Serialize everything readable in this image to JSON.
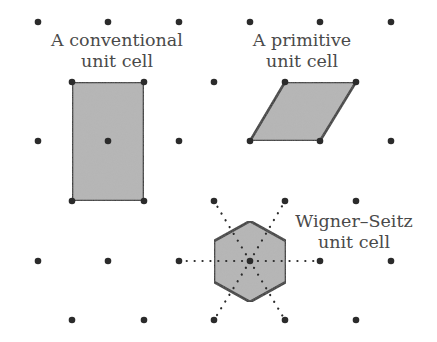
{
  "diagram": {
    "colors": {
      "background": "#ffffff",
      "lattice_point": "#2b2b2b",
      "cell_fill": "#b5b5b5",
      "cell_stroke": "#2b2b2b",
      "label_text": "#4a4a4a"
    },
    "lattice_points": [
      [
        38,
        22
      ],
      [
        108,
        22
      ],
      [
        179,
        22
      ],
      [
        250,
        22
      ],
      [
        320,
        22
      ],
      [
        391,
        22
      ],
      [
        72,
        82
      ],
      [
        144,
        82
      ],
      [
        214,
        82
      ],
      [
        285,
        82
      ],
      [
        356,
        82
      ],
      [
        38,
        141
      ],
      [
        108,
        141
      ],
      [
        179,
        141
      ],
      [
        250,
        141
      ],
      [
        320,
        141
      ],
      [
        391,
        141
      ],
      [
        72,
        201
      ],
      [
        144,
        201
      ],
      [
        214,
        201
      ],
      [
        285,
        201
      ],
      [
        356,
        201
      ],
      [
        38,
        261
      ],
      [
        108,
        261
      ],
      [
        179,
        261
      ],
      [
        250,
        261
      ],
      [
        320,
        261
      ],
      [
        391,
        261
      ],
      [
        72,
        320
      ],
      [
        144,
        320
      ],
      [
        214,
        320
      ],
      [
        285,
        320
      ],
      [
        356,
        320
      ]
    ],
    "cells": {
      "conventional": {
        "label_line1": "A conventional",
        "label_line2": "unit cell",
        "shape": "rectangle",
        "vertices": [
          [
            72,
            82
          ],
          [
            144,
            82
          ],
          [
            144,
            201
          ],
          [
            72,
            201
          ]
        ]
      },
      "primitive": {
        "label_line1": "A primitive",
        "label_line2": "unit cell",
        "shape": "parallelogram",
        "vertices": [
          [
            285,
            82
          ],
          [
            356,
            82
          ],
          [
            320,
            141
          ],
          [
            250,
            141
          ]
        ]
      },
      "wigner_seitz": {
        "label_line1": "Wigner–Seitz",
        "label_line2": "unit cell",
        "shape": "hexagon",
        "center": [
          250,
          261
        ],
        "vertices": [
          [
            250,
            221
          ],
          [
            286,
            241
          ],
          [
            286,
            282
          ],
          [
            250,
            302
          ],
          [
            214,
            282
          ],
          [
            214,
            241
          ]
        ],
        "neighbors": [
          [
            179,
            261
          ],
          [
            320,
            261
          ],
          [
            214,
            201
          ],
          [
            285,
            201
          ],
          [
            214,
            320
          ],
          [
            285,
            320
          ]
        ]
      }
    }
  }
}
